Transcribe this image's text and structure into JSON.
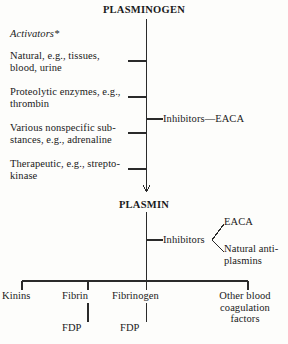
{
  "diagram": {
    "title_node": "PLASMINOGEN",
    "mid_node": "PLASMIN",
    "activators_caption": "Activators*",
    "activators": [
      "Natural, e.g., tissues,\nblood, urine",
      "Proteolytic enzymes, e.g.,\nthrombin",
      "Various nonspecific sub-\nstances, e.g., adrenaline",
      "Therapeutic, e.g., strepto-\nkinase"
    ],
    "inhibitors_top": "Inhibitors—EACA",
    "inhibitors_bottom_label": "Inhibitors",
    "inhibitors_bottom_branches": [
      "EACA",
      "Natural anti-\nplasmins"
    ],
    "products": [
      "Kinins",
      "Fibrin",
      "Fibrinogen",
      "Other blood\ncoagulation\nfactors"
    ],
    "degradation_products": [
      "FDP",
      "FDP"
    ],
    "colors": {
      "background": "#fdfdfb",
      "ink": "#1a1a1a",
      "line": "#2a2a2a"
    }
  }
}
